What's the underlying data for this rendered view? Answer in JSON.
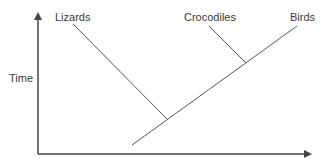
{
  "diagram": {
    "type": "cladogram",
    "axes": {
      "y_label": "Time",
      "x_label": ""
    },
    "taxa": [
      {
        "id": "lizards",
        "label": "Lizards"
      },
      {
        "id": "crocodiles",
        "label": "Crocodiles"
      },
      {
        "id": "birds",
        "label": "Birds"
      }
    ],
    "relationships": [
      {
        "branch": "lizards",
        "joins": "main-lineage",
        "order": 1
      },
      {
        "branch": "crocodiles",
        "joins": "main-lineage",
        "order": 2
      },
      {
        "branch": "birds",
        "terminal_of": "main-lineage"
      }
    ],
    "colors": {
      "line": "#555555",
      "axis": "#444444",
      "text": "#3a3a3a",
      "background": "#ffffff"
    }
  }
}
